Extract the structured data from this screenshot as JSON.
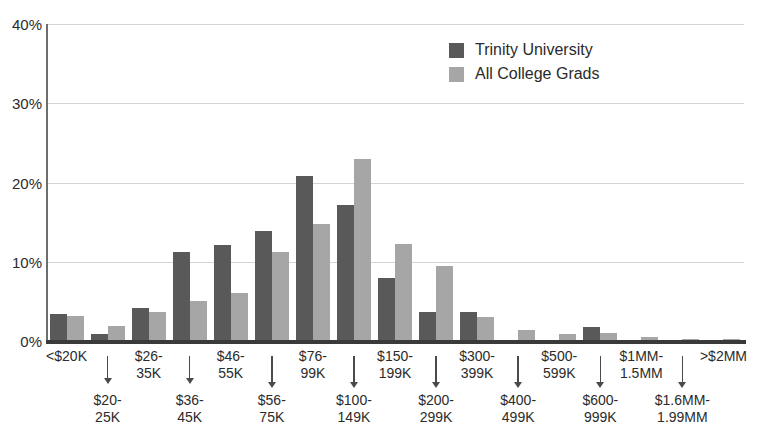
{
  "chart_data": {
    "type": "bar",
    "title": "",
    "xlabel": "",
    "ylabel": "",
    "ylim": [
      0,
      40
    ],
    "yticks": [
      "0%",
      "10%",
      "20%",
      "30%",
      "40%"
    ],
    "ytick_values": [
      0,
      10,
      20,
      30,
      40
    ],
    "grid": true,
    "legend_position": "top-center-right",
    "categories": [
      "<$20K",
      "$20-25K",
      "$26-35K",
      "$36-45K",
      "$46-55K",
      "$56-75K",
      "$76-99K",
      "$100-149K",
      "$150-199K",
      "$200-299K",
      "$300-399K",
      "$400-499K",
      "$500-599K",
      "$600-999K",
      "$1MM-1.5MM",
      "$1.6MM-1.99MM",
      ">$2MM"
    ],
    "category_lines": [
      [
        "<$20K"
      ],
      [
        "$20-",
        "25K"
      ],
      [
        "$26-",
        "35K"
      ],
      [
        "$36-",
        "45K"
      ],
      [
        "$46-",
        "55K"
      ],
      [
        "$56-",
        "75K"
      ],
      [
        "$76-",
        "99K"
      ],
      [
        "$100-",
        "149K"
      ],
      [
        "$150-",
        "199K"
      ],
      [
        "$200-",
        "299K"
      ],
      [
        "$300-",
        "399K"
      ],
      [
        "$400-",
        "499K"
      ],
      [
        "$500-",
        "599K"
      ],
      [
        "$600-",
        "999K"
      ],
      [
        "$1MM-",
        "1.5MM"
      ],
      [
        "$1.6MM-",
        "1.99MM"
      ],
      [
        ">$2MM"
      ]
    ],
    "series": [
      {
        "name": "Trinity University",
        "color": "#595959",
        "values": [
          3.4,
          0.9,
          4.2,
          11.2,
          12.1,
          13.9,
          20.8,
          17.2,
          8.0,
          3.6,
          3.6,
          0.0,
          0.0,
          1.8,
          0.0,
          0.0,
          0.0
        ]
      },
      {
        "name": "All College Grads",
        "color": "#a6a6a6",
        "values": [
          3.1,
          1.9,
          3.7,
          5.0,
          6.0,
          11.2,
          14.8,
          23.0,
          12.2,
          9.5,
          3.0,
          1.4,
          0.9,
          1.0,
          0.5,
          0.2,
          0.2
        ]
      }
    ]
  },
  "legend": {
    "items": [
      {
        "label": "Trinity University",
        "color": "#595959"
      },
      {
        "label": "All College Grads",
        "color": "#a6a6a6"
      }
    ]
  },
  "axis": {
    "y_ticks": [
      "40%",
      "30%",
      "20%",
      "10%",
      "0%"
    ]
  }
}
